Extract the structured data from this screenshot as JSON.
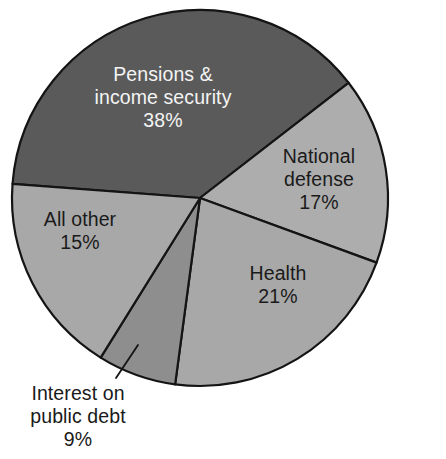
{
  "chart_data": {
    "type": "pie",
    "title": "",
    "subtitle": "",
    "xlabel": "",
    "ylabel": "",
    "legend": "none",
    "grid": false,
    "units": "percent",
    "total": 100,
    "categories": [
      "Pensions & income security",
      "National defense",
      "Health",
      "Interest on public debt",
      "All other"
    ],
    "values": [
      38,
      17,
      21,
      9,
      15
    ],
    "slices": [
      {
        "name": "pensions-income-security",
        "label_line1": "Pensions &",
        "label_line2": "income security",
        "value": 38,
        "percent_text": "38%",
        "color": "#5a5a5a",
        "text_color": "#f4f4f4",
        "label_placement": "inside",
        "start_angle_deg": 184.3,
        "end_angle_deg": 322.2
      },
      {
        "name": "national-defense",
        "label_line1": "National",
        "label_line2": "defense",
        "value": 17,
        "percent_text": "17%",
        "color": "#adadad",
        "text_color": "#1a1a1a",
        "label_placement": "inside",
        "start_angle_deg": 322.2,
        "end_angle_deg": 20.1
      },
      {
        "name": "health",
        "label_line1": "Health",
        "label_line2": "",
        "value": 21,
        "percent_text": "21%",
        "color": "#a8a8a8",
        "text_color": "#1a1a1a",
        "label_placement": "inside",
        "start_angle_deg": 20.1,
        "end_angle_deg": 97.6
      },
      {
        "name": "interest-on-public-debt",
        "label_line1": "Interest on",
        "label_line2": "public debt",
        "value": 9,
        "percent_text": "9%",
        "color": "#8e8e8e",
        "text_color": "#1a1a1a",
        "label_placement": "outside",
        "start_angle_deg": 97.6,
        "end_angle_deg": 121.9
      },
      {
        "name": "all-other",
        "label_line1": "All other",
        "label_line2": "",
        "value": 15,
        "percent_text": "15%",
        "color": "#a8a8a8",
        "text_color": "#1a1a1a",
        "label_placement": "inside",
        "start_angle_deg": 121.9,
        "end_angle_deg": 184.3
      }
    ],
    "geometry": {
      "center_x": 200,
      "center_y": 198,
      "radius": 188,
      "outline_color": "#141414"
    },
    "colors": {
      "background": "#ffffff",
      "dark_slice": "#5a5a5a",
      "light_slice": "#a8a8a8",
      "mid_slice": "#8e8e8e",
      "outline": "#141414",
      "label_dark": "#1a1a1a",
      "label_light": "#f4f4f4"
    }
  }
}
